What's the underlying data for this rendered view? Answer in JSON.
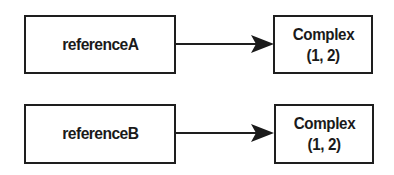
{
  "diagram": {
    "type": "reference-to-object",
    "references": [
      {
        "label": "referenceA"
      },
      {
        "label": "referenceB"
      }
    ],
    "objects": [
      {
        "title": "Complex",
        "value": "(1, 2)"
      },
      {
        "title": "Complex",
        "value": "(1, 2)"
      }
    ],
    "edges": [
      {
        "from": "referenceA",
        "to": "object-0",
        "style": "arrow"
      },
      {
        "from": "referenceB",
        "to": "object-1",
        "style": "arrow"
      }
    ],
    "colors": {
      "stroke": "#1e1e1e",
      "background": "#ffffff",
      "text": "#1a1a1a"
    }
  }
}
